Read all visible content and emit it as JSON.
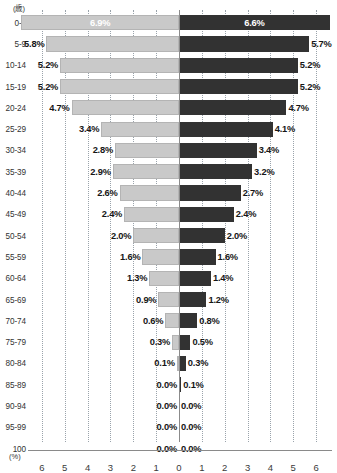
{
  "chart_data": {
    "type": "bar",
    "subtype": "population-pyramid",
    "title": "",
    "xlabel": "(%)",
    "ylabel": "(歳)",
    "orientation": "horizontal-diverging",
    "grid": true,
    "legend_position": "none",
    "xlim": [
      -6.5,
      6.5
    ],
    "axis_ticks": [
      6,
      5,
      4,
      3,
      2,
      1,
      0,
      1,
      2,
      3,
      4,
      5,
      6
    ],
    "categories": [
      "0-4",
      "5-9",
      "10-14",
      "15-19",
      "20-24",
      "25-29",
      "30-34",
      "35-39",
      "40-44",
      "45-49",
      "50-54",
      "55-59",
      "60-64",
      "65-69",
      "70-74",
      "75-79",
      "80-84",
      "85-89",
      "90-94",
      "95-99",
      "100"
    ],
    "series": [
      {
        "name": "left",
        "side": "left",
        "color": "#c9c9c9",
        "values": [
          6.9,
          5.8,
          5.2,
          5.2,
          4.7,
          3.4,
          2.8,
          2.9,
          2.6,
          2.4,
          2.0,
          1.6,
          1.3,
          0.9,
          0.6,
          0.3,
          0.1,
          0.0,
          0.0,
          0.0,
          0.0
        ],
        "labels": [
          "6.9%",
          "5.8%",
          "5.2%",
          "5.2%",
          "4.7%",
          "3.4%",
          "2.8%",
          "2.9%",
          "2.6%",
          "2.4%",
          "2.0%",
          "1.6%",
          "1.3%",
          "0.9%",
          "0.6%",
          "0.3%",
          "0.1%",
          "0.0%",
          "0.0%",
          "0.0%",
          "0.0%"
        ]
      },
      {
        "name": "right",
        "side": "right",
        "color": "#323232",
        "values": [
          6.6,
          5.7,
          5.2,
          5.2,
          4.7,
          4.1,
          3.4,
          3.2,
          2.7,
          2.4,
          2.0,
          1.6,
          1.4,
          1.2,
          0.8,
          0.5,
          0.3,
          0.1,
          0.0,
          0.0,
          0.0
        ],
        "labels": [
          "6.6%",
          "5.7%",
          "5.2%",
          "5.2%",
          "4.7%",
          "4.1%",
          "3.4%",
          "3.2%",
          "2.7%",
          "2.4%",
          "2.0%",
          "1.6%",
          "1.4%",
          "1.2%",
          "0.8%",
          "0.5%",
          "0.3%",
          "0.1%",
          "0.0%",
          "0.0%",
          "0.0%"
        ]
      }
    ]
  },
  "axis": {
    "y_unit": "(歳)",
    "x_unit": "(%)",
    "tick_labels": [
      "6",
      "5",
      "4",
      "3",
      "2",
      "1",
      "0",
      "1",
      "2",
      "3",
      "4",
      "5",
      "6"
    ]
  },
  "colors": {
    "left_bar": "#c9c9c9",
    "right_bar": "#323232",
    "gridline": "#9aa3ab",
    "axis": "#8a8a8a",
    "text": "#1a1a1a",
    "background": "#ffffff"
  }
}
